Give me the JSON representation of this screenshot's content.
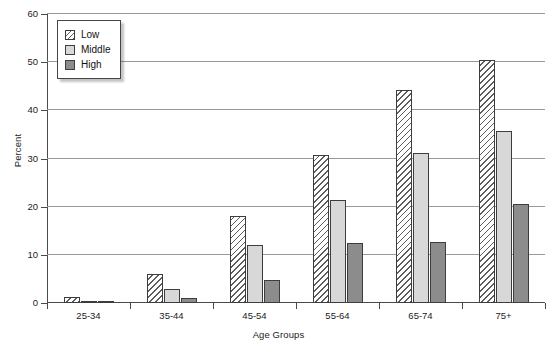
{
  "chart_data": {
    "type": "bar",
    "title": "",
    "xlabel": "Age Groups",
    "ylabel": "Percent",
    "categories": [
      "25-34",
      "35-44",
      "45-54",
      "55-64",
      "65-74",
      "75+"
    ],
    "series": [
      {
        "name": "Low",
        "values": [
          1.2,
          6.0,
          18.0,
          30.7,
          44.2,
          50.4
        ]
      },
      {
        "name": "Middle",
        "values": [
          0.4,
          2.9,
          12.0,
          21.4,
          31.2,
          35.7
        ]
      },
      {
        "name": "High",
        "values": [
          0.3,
          1.1,
          4.8,
          12.4,
          12.6,
          20.6
        ]
      }
    ],
    "ylim": [
      0,
      60
    ],
    "yticks": [
      0,
      10,
      20,
      30,
      40,
      50,
      60
    ],
    "ytick_labels": [
      "0",
      "10",
      "20",
      "30",
      "40",
      "50",
      "60"
    ],
    "grid": true,
    "legend_position": "upper-left",
    "colors": {
      "low": "#ffffff",
      "middle": "#d8d8d8",
      "high": "#8c8c8c",
      "outline": "#3d3d3d",
      "gridline": "#9a9a9a",
      "axis": "#4a4a4a",
      "text": "#1c1c1c"
    }
  },
  "legend": {
    "items": [
      {
        "label": "Low",
        "swatch": "hatched-swatch"
      },
      {
        "label": "Middle",
        "swatch": "light-gray-swatch"
      },
      {
        "label": "High",
        "swatch": "dark-gray-swatch"
      }
    ]
  }
}
